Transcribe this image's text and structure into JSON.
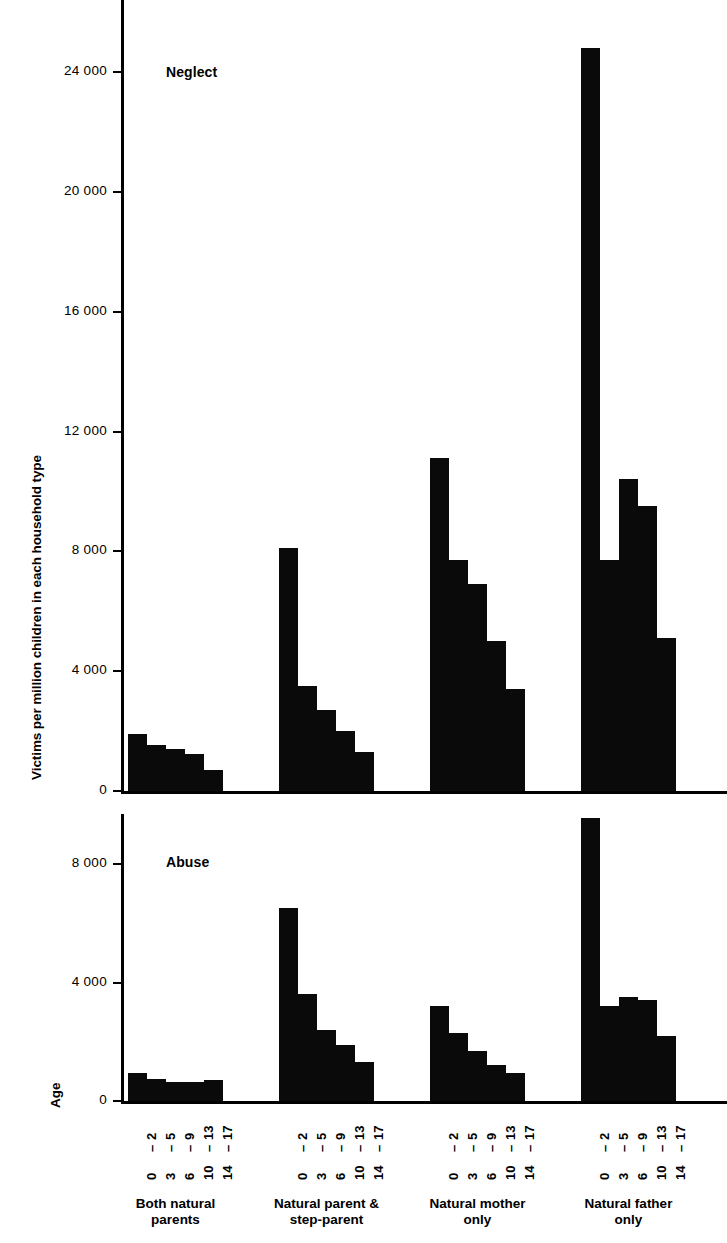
{
  "axis": {
    "y_title": "Victims per million children in each household type",
    "age_caption": "Age"
  },
  "panels": [
    {
      "title": "Neglect",
      "yticks": [
        "0",
        "4 000",
        "8 000",
        "12 000",
        "16 000",
        "20 000",
        "24 000"
      ],
      "ytick_values": [
        0,
        4000,
        8000,
        12000,
        16000,
        20000,
        24000
      ]
    },
    {
      "title": "Abuse",
      "yticks": [
        "0",
        "4 000",
        "8 000"
      ],
      "ytick_values": [
        0,
        4000,
        8000
      ]
    }
  ],
  "age_groups": [
    "0 - 2",
    "3 - 5",
    "6 - 9",
    "10 - 13",
    "14 - 17"
  ],
  "age_labels_top": [
    "2",
    "5",
    "9",
    "13",
    "17"
  ],
  "age_labels_bottom": [
    "0",
    "3",
    "6",
    "10",
    "14"
  ],
  "household_types": [
    "Both natural\nparents",
    "Natural parent &\nstep-parent",
    "Natural mother\nonly",
    "Natural father\nonly"
  ],
  "colors": {
    "bar": "#0a0a0a",
    "axis": "#000000",
    "background": "#ffffff"
  },
  "chart_data": {
    "type": "bar",
    "xlabel": "Age",
    "ylabel": "Victims per million children in each household type",
    "grid": false,
    "legend": false,
    "categories": [
      "0 - 2",
      "3 - 5",
      "6 - 9",
      "10 - 13",
      "14 - 17"
    ],
    "panels": [
      {
        "name": "Neglect",
        "ylim": [
          0,
          25500
        ],
        "yticks": [
          0,
          4000,
          8000,
          12000,
          16000,
          20000,
          24000
        ],
        "series": [
          {
            "name": "Both natural parents",
            "values": [
              1900,
              1550,
              1400,
              1250,
              700
            ]
          },
          {
            "name": "Natural parent & step-parent",
            "values": [
              8100,
              3500,
              2700,
              2000,
              1300
            ]
          },
          {
            "name": "Natural mother only",
            "values": [
              11100,
              7700,
              6900,
              5000,
              3400
            ]
          },
          {
            "name": "Natural father only",
            "values": [
              24800,
              7700,
              10400,
              9500,
              5100
            ]
          }
        ]
      },
      {
        "name": "Abuse",
        "ylim": [
          0,
          9800
        ],
        "yticks": [
          0,
          4000,
          8000
        ],
        "clipped_bars": [
          {
            "series": "Natural father only",
            "category": "0 - 2",
            "note": "bar extends above plotted axis range"
          }
        ],
        "series": [
          {
            "name": "Both natural parents",
            "values": [
              950,
              750,
              650,
              650,
              700
            ]
          },
          {
            "name": "Natural parent & step-parent",
            "values": [
              6500,
              3600,
              2400,
              1900,
              1300
            ]
          },
          {
            "name": "Natural mother only",
            "values": [
              3200,
              2300,
              1700,
              1200,
              950
            ]
          },
          {
            "name": "Natural father only",
            "values": [
              9800,
              3200,
              3500,
              3400,
              2200
            ]
          }
        ]
      }
    ]
  }
}
